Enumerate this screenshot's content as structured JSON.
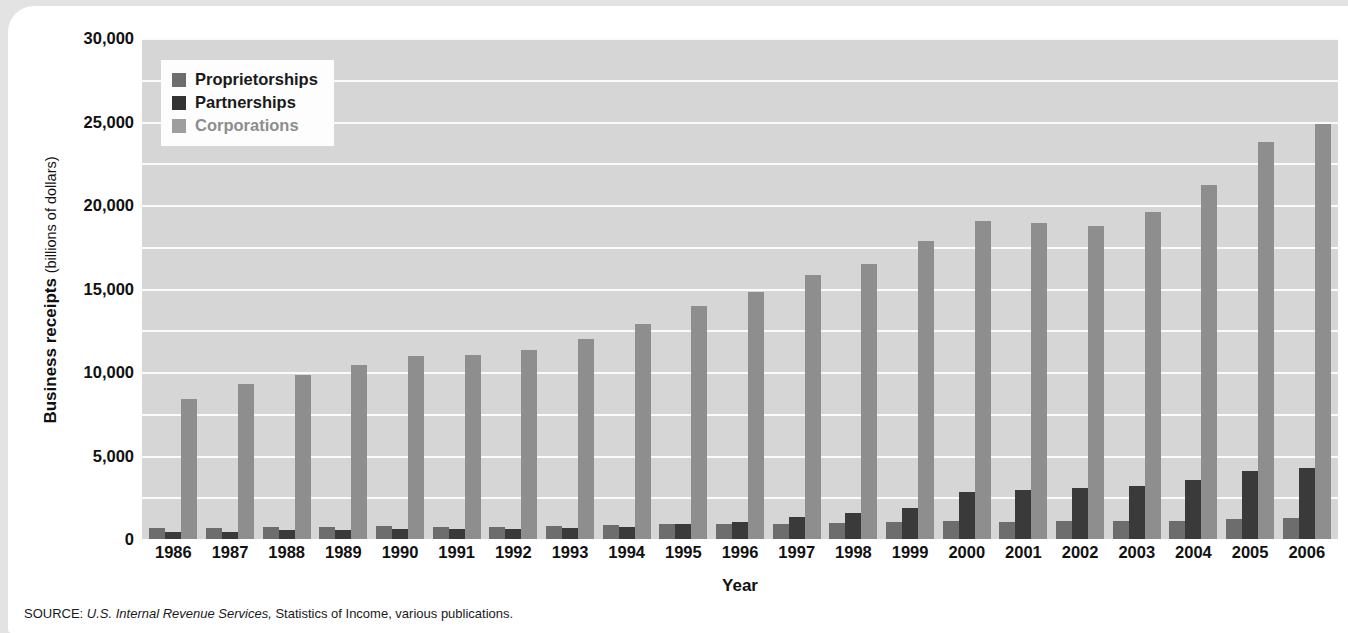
{
  "chart_data": {
    "type": "bar",
    "title": "",
    "xlabel": "Year",
    "ylabel": "Business receipts",
    "ylabel_unit": "(billions of dollars)",
    "ylim": [
      0,
      30000
    ],
    "ytick_step": 5000,
    "grid": true,
    "grid_step": 2500,
    "legend_position": "top-left",
    "categories": [
      "1986",
      "1987",
      "1988",
      "1989",
      "1990",
      "1991",
      "1992",
      "1993",
      "1994",
      "1995",
      "1996",
      "1997",
      "1998",
      "1999",
      "2000",
      "2001",
      "2002",
      "2003",
      "2004",
      "2005",
      "2006"
    ],
    "series": [
      {
        "name": "Proprietorships",
        "color": "#6d6d6d",
        "values": [
          660,
          680,
          700,
          720,
          760,
          720,
          740,
          790,
          820,
          870,
          900,
          920,
          940,
          1030,
          1060,
          1040,
          1060,
          1070,
          1100,
          1180,
          1280
        ]
      },
      {
        "name": "Partnerships",
        "color": "#333333",
        "values": [
          420,
          440,
          530,
          560,
          570,
          580,
          620,
          640,
          740,
          870,
          1000,
          1300,
          1550,
          1880,
          2800,
          2960,
          3030,
          3180,
          3560,
          4050,
          4280
        ]
      },
      {
        "name": "Corporations",
        "color": "#8e8e8e",
        "values": [
          8400,
          9300,
          9850,
          10450,
          10950,
          11000,
          11300,
          11950,
          12850,
          13950,
          14800,
          15800,
          16450,
          17850,
          19050,
          18950,
          18750,
          19600,
          21200,
          23750,
          24850
        ]
      }
    ]
  },
  "legend": {
    "items": [
      {
        "label": "Proprietorships"
      },
      {
        "label": "Partnerships"
      },
      {
        "label": "Corporations"
      }
    ]
  },
  "yticks": [
    {
      "label": "30,000",
      "value": 30000
    },
    {
      "label": "25,000",
      "value": 25000
    },
    {
      "label": "20,000",
      "value": 20000
    },
    {
      "label": "15,000",
      "value": 15000
    },
    {
      "label": "10,000",
      "value": 10000
    },
    {
      "label": "5,000",
      "value": 5000
    },
    {
      "label": "0",
      "value": 0
    }
  ],
  "source": {
    "prefix": "SOURCE: ",
    "italic": "U.S. Internal Revenue Services,",
    "rest": " Statistics of Income, various publications."
  }
}
